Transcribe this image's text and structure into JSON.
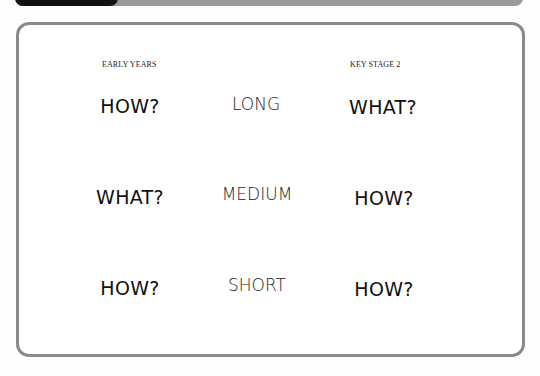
{
  "header": {
    "tab_color": "#111111",
    "band_color": "#9a9a9a"
  },
  "frame": {
    "border_color": "#8a8a8a"
  },
  "columns": {
    "left_label": "EARLY YEARS",
    "right_label": "KEY STAGE 2"
  },
  "rows": [
    {
      "left": "HOW?",
      "middle": "LONG",
      "right": "WHAT?"
    },
    {
      "left": "WHAT?",
      "middle": "MEDIUM",
      "right": "HOW?"
    },
    {
      "left": "HOW?",
      "middle": "SHORT",
      "right": "HOW?"
    }
  ]
}
